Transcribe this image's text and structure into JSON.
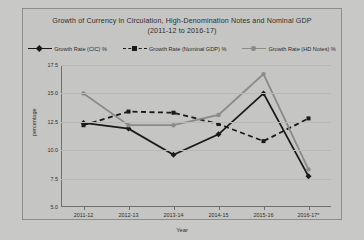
{
  "chart_data": {
    "type": "line",
    "title": "Growth of Currency in Circulation, High-Denomination Notes and Nominal GDP",
    "subtitle": "(2011-12 to 2016-17)",
    "xlabel": "Year",
    "ylabel": "percentage",
    "categories": [
      "2011-12",
      "2012-13",
      "2013-14",
      "2014-15",
      "2015-16",
      "2016-17*"
    ],
    "ylim": [
      5.0,
      17.5
    ],
    "yticks": [
      "5.0",
      "7.5",
      "10.0",
      "12.5",
      "15.0",
      "17.5"
    ],
    "ytick_values": [
      5.0,
      7.5,
      10.0,
      12.5,
      15.0,
      17.5
    ],
    "grid": true,
    "legend_position": "top",
    "series": [
      {
        "name": "Growth Rate (CIC) %",
        "values": [
          12.4,
          11.9,
          9.6,
          11.4,
          15.0,
          7.7
        ],
        "color": "#1a1a1a",
        "dash": "none",
        "marker": "diamond"
      },
      {
        "name": "Growth Rate (Nominal GDP) %",
        "values": [
          12.2,
          13.4,
          13.3,
          12.3,
          10.8,
          12.8
        ],
        "color": "#1a1a1a",
        "dash": "dashed",
        "marker": "square"
      },
      {
        "name": "Growth Rate (HD Notes) %",
        "values": [
          15.0,
          12.2,
          12.2,
          13.1,
          16.7,
          8.3
        ],
        "color": "#8a8a88",
        "dash": "none",
        "marker": "circle"
      }
    ]
  }
}
